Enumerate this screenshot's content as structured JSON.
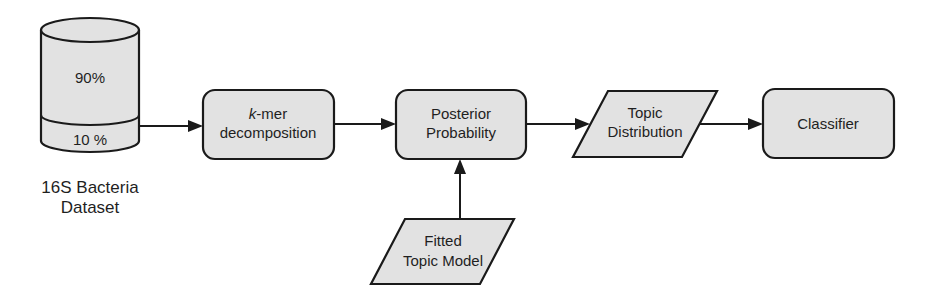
{
  "diagram": {
    "colors": {
      "fill": "#e2e2e2",
      "stroke": "#1a1a1a",
      "text": "#1f1f1f",
      "background": "#ffffff"
    },
    "dataset": {
      "upper_label": "90%",
      "lower_label": "10 %",
      "caption_line1": "16S Bacteria",
      "caption_line2": "Dataset"
    },
    "nodes": [
      {
        "id": "kmer",
        "shape": "rounded-rect",
        "line1_italic": "k",
        "line1_rest": "-mer",
        "line2": "decomposition"
      },
      {
        "id": "posterior",
        "shape": "rounded-rect",
        "line1": "Posterior",
        "line2": "Probability"
      },
      {
        "id": "topic_distribution",
        "shape": "parallelogram",
        "line1": "Topic",
        "line2": "Distribution"
      },
      {
        "id": "classifier",
        "shape": "rounded-rect",
        "line1": "Classifier"
      },
      {
        "id": "fitted_model",
        "shape": "parallelogram",
        "line1": "Fitted",
        "line2": "Topic Model"
      }
    ],
    "edges": [
      {
        "from": "dataset_10pct",
        "to": "kmer"
      },
      {
        "from": "kmer",
        "to": "posterior"
      },
      {
        "from": "posterior",
        "to": "topic_distribution"
      },
      {
        "from": "topic_distribution",
        "to": "classifier"
      },
      {
        "from": "fitted_model",
        "to": "posterior"
      }
    ]
  }
}
